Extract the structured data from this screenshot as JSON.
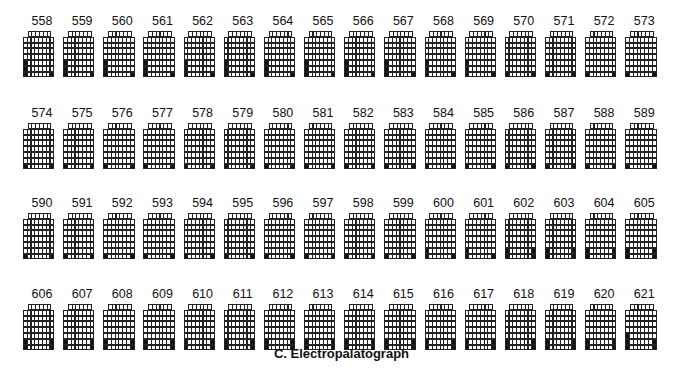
{
  "figure": {
    "caption": "C. Electropalatograph",
    "grid": {
      "rows": 8,
      "cols": 8,
      "first_row_cols": 6,
      "on_color": "#111111",
      "off_color": "#ffffff",
      "line_color": "#222222"
    },
    "patterns": {
      "A": [
        [
          6,
          1
        ],
        [
          7,
          1
        ],
        [
          8,
          1
        ],
        [
          8,
          8
        ]
      ],
      "B": [
        [
          8,
          1
        ],
        [
          8,
          8
        ]
      ],
      "C": [
        [
          7,
          1
        ],
        [
          8,
          1
        ],
        [
          8,
          8
        ]
      ],
      "D": [
        [
          7,
          1
        ],
        [
          8,
          1
        ],
        [
          7,
          8
        ],
        [
          8,
          8
        ]
      ],
      "E": [
        [
          6,
          1
        ],
        [
          7,
          1
        ],
        [
          8,
          1
        ],
        [
          7,
          8
        ],
        [
          8,
          8
        ]
      ]
    },
    "frame_rows": [
      {
        "y": 14,
        "frames": [
          {
            "n": "558",
            "p": "A"
          },
          {
            "n": "559",
            "p": "A"
          },
          {
            "n": "560",
            "p": "A"
          },
          {
            "n": "561",
            "p": "A"
          },
          {
            "n": "562",
            "p": "A"
          },
          {
            "n": "563",
            "p": "A"
          },
          {
            "n": "564",
            "p": "A"
          },
          {
            "n": "565",
            "p": "A"
          },
          {
            "n": "566",
            "p": "A"
          },
          {
            "n": "567",
            "p": "A"
          },
          {
            "n": "568",
            "p": "A"
          },
          {
            "n": "569",
            "p": "A"
          },
          {
            "n": "570",
            "p": "B"
          },
          {
            "n": "571",
            "p": "B"
          },
          {
            "n": "572",
            "p": "B"
          },
          {
            "n": "573",
            "p": "B"
          }
        ]
      },
      {
        "y": 106,
        "frames": [
          {
            "n": "574",
            "p": "B"
          },
          {
            "n": "575",
            "p": "B"
          },
          {
            "n": "576",
            "p": "B"
          },
          {
            "n": "577",
            "p": "B"
          },
          {
            "n": "578",
            "p": "B"
          },
          {
            "n": "579",
            "p": "B"
          },
          {
            "n": "580",
            "p": "B"
          },
          {
            "n": "581",
            "p": "B"
          },
          {
            "n": "582",
            "p": "B"
          },
          {
            "n": "583",
            "p": "B"
          },
          {
            "n": "584",
            "p": "B"
          },
          {
            "n": "585",
            "p": "B"
          },
          {
            "n": "586",
            "p": "B"
          },
          {
            "n": "587",
            "p": "B"
          },
          {
            "n": "588",
            "p": "B"
          },
          {
            "n": "589",
            "p": "B"
          }
        ]
      },
      {
        "y": 196,
        "frames": [
          {
            "n": "590",
            "p": "B"
          },
          {
            "n": "591",
            "p": "B"
          },
          {
            "n": "592",
            "p": "B"
          },
          {
            "n": "593",
            "p": "B"
          },
          {
            "n": "594",
            "p": "B"
          },
          {
            "n": "595",
            "p": "B"
          },
          {
            "n": "596",
            "p": "B"
          },
          {
            "n": "597",
            "p": "B"
          },
          {
            "n": "598",
            "p": "B"
          },
          {
            "n": "599",
            "p": "B"
          },
          {
            "n": "600",
            "p": "C"
          },
          {
            "n": "601",
            "p": "C"
          },
          {
            "n": "602",
            "p": "D"
          },
          {
            "n": "603",
            "p": "D"
          },
          {
            "n": "604",
            "p": "D"
          },
          {
            "n": "605",
            "p": "D"
          }
        ]
      },
      {
        "y": 287,
        "frames": [
          {
            "n": "606",
            "p": "D"
          },
          {
            "n": "607",
            "p": "D"
          },
          {
            "n": "608",
            "p": "D"
          },
          {
            "n": "609",
            "p": "D"
          },
          {
            "n": "610",
            "p": "D"
          },
          {
            "n": "611",
            "p": "D"
          },
          {
            "n": "612",
            "p": "D"
          },
          {
            "n": "613",
            "p": "D"
          },
          {
            "n": "614",
            "p": "D"
          },
          {
            "n": "615",
            "p": "D"
          },
          {
            "n": "616",
            "p": "D"
          },
          {
            "n": "617",
            "p": "D"
          },
          {
            "n": "618",
            "p": "D"
          },
          {
            "n": "619",
            "p": "D"
          },
          {
            "n": "620",
            "p": "D"
          },
          {
            "n": "621",
            "p": "E"
          }
        ]
      }
    ]
  }
}
